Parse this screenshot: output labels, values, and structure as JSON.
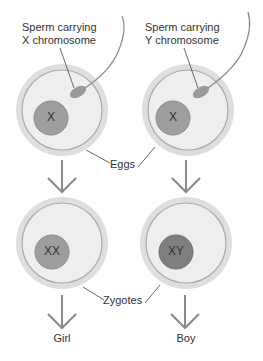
{
  "labels": {
    "sperm_x": [
      "Sperm carrying",
      "X chromosome"
    ],
    "sperm_y": [
      "Sperm carrying",
      "Y chromosome"
    ],
    "eggs": "Eggs",
    "zygotes": "Zygotes",
    "girl": "Girl",
    "boy": "Boy"
  },
  "nuclei": {
    "egg_left": "X",
    "egg_right": "X",
    "zygote_left": "XX",
    "zygote_right": "XY"
  },
  "colors": {
    "membrane_outer": "#d9d9d9",
    "membrane_ring": "#a8a8a8",
    "cytoplasm": "#ececec",
    "nucleus_light": "#9c9c9c",
    "nucleus_dark": "#7f7f7f",
    "arrow": "#8a8a8a",
    "line": "#444444"
  }
}
